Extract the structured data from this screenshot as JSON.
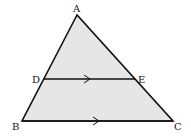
{
  "diagram": {
    "fill_color": "#e6e6e6",
    "stroke_color": "#111111",
    "points": {
      "A": {
        "label": "A"
      },
      "B": {
        "label": "B"
      },
      "C": {
        "label": "C"
      },
      "D": {
        "label": "D"
      },
      "E": {
        "label": "E"
      }
    },
    "segments": [
      "AB",
      "AC",
      "BC",
      "DE"
    ],
    "parallel_marks": [
      "DE",
      "BC"
    ]
  }
}
